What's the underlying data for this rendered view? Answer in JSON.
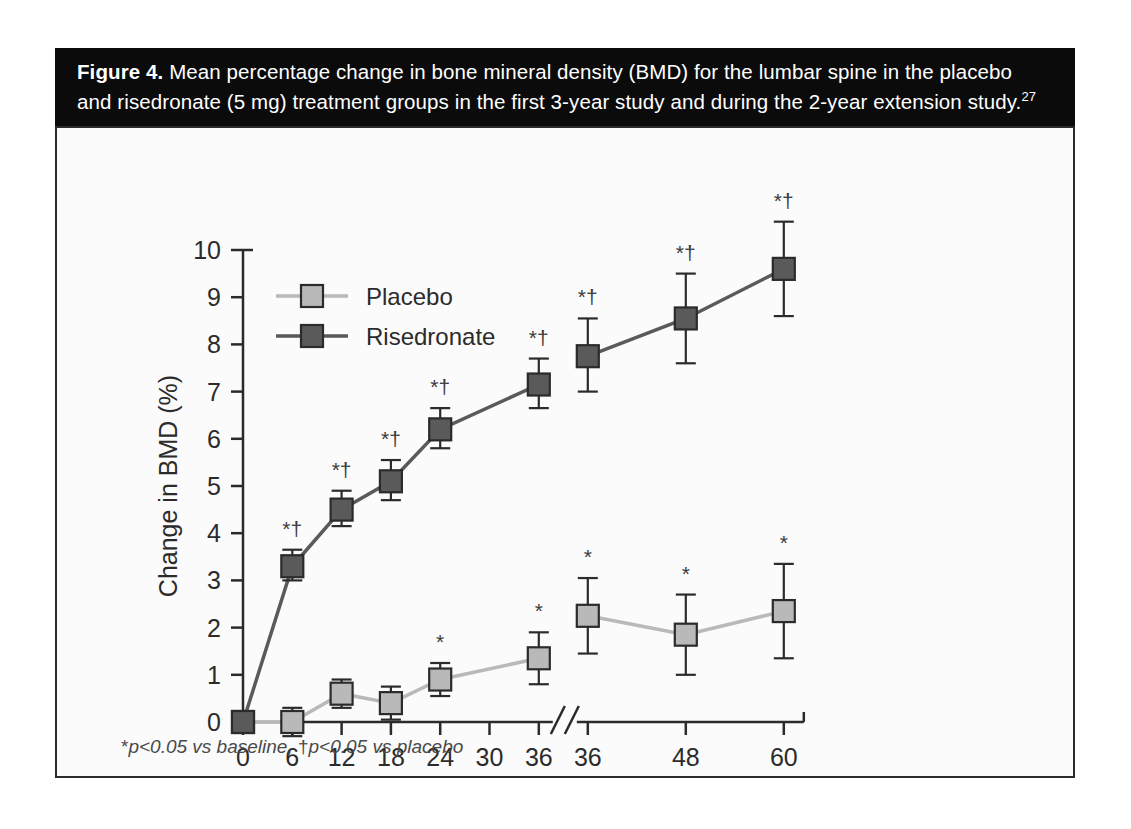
{
  "figure": {
    "caption_prefix": "Figure 4.",
    "caption_line1": " Mean percentage change in bone mineral density (BMD) for the lumbar spine in the placebo",
    "caption_line2": "and risedronate (5 mg) treatment groups in the first 3-year study and during the 2-year extension study.",
    "caption_reference": "27",
    "footnote_star": "*",
    "footnote_text_a": "p<0.05 vs baseline, ",
    "footnote_dagger": "†",
    "footnote_text_b": "p<0.05 vs placebo"
  },
  "colors": {
    "placebo": "#b9b9b9",
    "risedronate": "#5a5a5a",
    "marker_edge": "#2b2b2b",
    "axis": "#2b2b2b",
    "caption_bar": "#0b0b0b",
    "caption_text": "#ffffff",
    "plot_background": "#fbfbfb"
  },
  "chart_data": {
    "type": "line",
    "title": "Mean percentage change in bone mineral density (BMD) for the lumbar spine",
    "xlabel": "Time (months)",
    "ylabel": "Change in BMD (%)",
    "ylim": [
      0,
      10
    ],
    "yticks": [
      0,
      1,
      2,
      3,
      4,
      5,
      6,
      7,
      8,
      9,
      10
    ],
    "ytick_labels": [
      "0",
      "1",
      "2",
      "3",
      "4",
      "5",
      "6",
      "7",
      "8",
      "9",
      "10"
    ],
    "x": [
      0,
      6,
      12,
      18,
      24,
      30,
      36,
      36,
      48,
      60
    ],
    "xtick_labels": [
      "0",
      "6",
      "12",
      "18",
      "24",
      "30",
      "36",
      "36",
      "48",
      "60"
    ],
    "axis_break_after_index": 6,
    "axis_break_label": "//",
    "grid": false,
    "legend_position": "top-left",
    "series": [
      {
        "name": "Placebo",
        "color": "#b9b9b9",
        "x": [
          0,
          6,
          12,
          18,
          24,
          36,
          36,
          48,
          60
        ],
        "values": [
          0.0,
          0.0,
          0.6,
          0.4,
          0.9,
          1.35,
          2.25,
          1.85,
          2.35
        ],
        "err_low": [
          0.0,
          0.3,
          0.3,
          0.35,
          0.35,
          0.55,
          0.8,
          0.85,
          1.0
        ],
        "err_high": [
          0.0,
          0.3,
          0.3,
          0.35,
          0.35,
          0.55,
          0.8,
          0.85,
          1.0
        ],
        "significance": [
          "",
          "",
          "",
          "",
          "*",
          "*",
          "*",
          "*",
          "*"
        ]
      },
      {
        "name": "Risedronate",
        "color": "#5a5a5a",
        "x": [
          0,
          6,
          12,
          18,
          24,
          36,
          36,
          48,
          60
        ],
        "values": [
          0.0,
          3.3,
          4.5,
          5.1,
          6.2,
          7.15,
          7.75,
          8.55,
          9.6
        ],
        "err_low": [
          0.0,
          0.3,
          0.35,
          0.4,
          0.4,
          0.5,
          0.75,
          0.95,
          1.0
        ],
        "err_high": [
          0.0,
          0.35,
          0.4,
          0.45,
          0.45,
          0.55,
          0.8,
          0.95,
          1.0
        ],
        "significance": [
          "",
          "*†",
          "*†",
          "*†",
          "*†",
          "*†",
          "*†",
          "*†",
          "*†"
        ]
      }
    ]
  }
}
